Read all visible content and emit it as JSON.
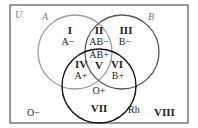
{
  "diagram": {
    "universe_label": "U",
    "sets": [
      {
        "name": "A",
        "stroke": "#9a9a9a"
      },
      {
        "name": "B",
        "stroke": "#555555"
      },
      {
        "name": "Rh",
        "stroke": "#111111"
      }
    ],
    "regions": [
      {
        "id": "I",
        "blood_type": "A−"
      },
      {
        "id": "II",
        "blood_type": "AB−"
      },
      {
        "id": "III",
        "blood_type": "B−"
      },
      {
        "id": "IV",
        "blood_type": "A+"
      },
      {
        "id": "V",
        "blood_type": "AB+"
      },
      {
        "id": "VI",
        "blood_type": "B+"
      },
      {
        "id": "VII",
        "blood_type": "O+"
      },
      {
        "id": "VIII",
        "blood_type": "O−"
      }
    ]
  }
}
